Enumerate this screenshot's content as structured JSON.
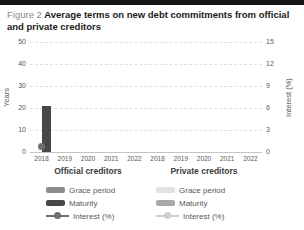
{
  "title": {
    "prefix": "Figure 2",
    "text": "Average terms on new debt commitments from official and private creditors"
  },
  "chart_data": {
    "type": "bar",
    "title": "Average terms on new debt commitments from official and private creditors",
    "left_axis": {
      "label": "Years",
      "ticks": [
        50,
        40,
        30,
        20,
        10,
        0
      ],
      "min": 0,
      "max": 50
    },
    "right_axis": {
      "label": "Interest (%)",
      "ticks": [
        15,
        12,
        9,
        6,
        3,
        0
      ],
      "min": 0,
      "max": 15
    },
    "grid": true,
    "legend_position": "bottom",
    "groups": [
      {
        "name": "Official creditors",
        "categories": [
          "2018",
          "2019",
          "2020",
          "2021",
          "2022"
        ],
        "series": [
          {
            "name": "Grace period",
            "type": "bar",
            "axis": "left",
            "color": "#8c8c8c",
            "values": [
              null,
              null,
              null,
              null,
              null
            ]
          },
          {
            "name": "Maturity",
            "type": "bar",
            "axis": "left",
            "color": "#474747",
            "values": [
              20.7,
              null,
              null,
              null,
              null
            ]
          },
          {
            "name": "Interest (%)",
            "type": "line",
            "axis": "right",
            "color": "#6f6f6f",
            "values": [
              0.7,
              null,
              null,
              null,
              null
            ]
          }
        ]
      },
      {
        "name": "Private creditors",
        "categories": [
          "2018",
          "2019",
          "2020",
          "2021",
          "2022"
        ],
        "series": [
          {
            "name": "Grace period",
            "type": "bar",
            "axis": "left",
            "color": "#e2e2e2",
            "values": [
              null,
              null,
              null,
              null,
              null
            ]
          },
          {
            "name": "Maturity",
            "type": "bar",
            "axis": "left",
            "color": "#a9a9a9",
            "values": [
              null,
              null,
              null,
              null,
              null
            ]
          },
          {
            "name": "Interest (%)",
            "type": "line",
            "axis": "right",
            "color": "#cfcfcf",
            "values": [
              null,
              null,
              null,
              null,
              null
            ]
          }
        ]
      }
    ]
  },
  "colors": {
    "topbar": "#161616",
    "grid": "#e0e0e0",
    "axis_line": "#c4c4c4",
    "tick_text": "#595959",
    "group_title_text": "#3d3d3d",
    "title_prefix": "#8a8a8a"
  }
}
